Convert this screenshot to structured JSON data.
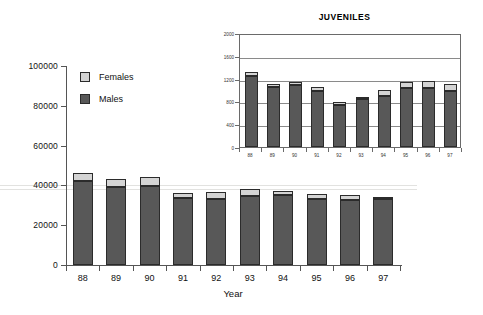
{
  "chart_data": [
    {
      "id": "main",
      "type": "bar",
      "subtype": "stacked",
      "title": "",
      "xlabel": "Year",
      "ylabel": "",
      "categories": [
        "88",
        "89",
        "90",
        "91",
        "92",
        "93",
        "94",
        "95",
        "96",
        "97"
      ],
      "ylim": [
        0,
        100000
      ],
      "yticks": [
        0,
        20000,
        40000,
        60000,
        80000,
        100000
      ],
      "ytick_labels": [
        "0",
        "20000",
        "40000",
        "60000",
        "80000",
        "100000"
      ],
      "grid": true,
      "legend_position": "upper-left-inside",
      "series": [
        {
          "name": "Males",
          "color": "#585858",
          "values": [
            42000,
            39000,
            39500,
            33500,
            33000,
            34500,
            35000,
            33000,
            32500,
            33000
          ]
        },
        {
          "name": "Females",
          "color": "#d4d4d4",
          "values": [
            4000,
            4000,
            4500,
            2500,
            3500,
            3500,
            2000,
            2500,
            2500,
            1000
          ]
        }
      ],
      "totals": [
        46000,
        43000,
        44000,
        36000,
        36500,
        38000,
        37000,
        35500,
        35000,
        34000
      ]
    },
    {
      "id": "inset",
      "type": "bar",
      "subtype": "stacked",
      "title": "JUVENILES",
      "xlabel": "",
      "ylabel": "",
      "categories": [
        "88",
        "89",
        "90",
        "91",
        "92",
        "93",
        "94",
        "95",
        "96",
        "97"
      ],
      "ylim": [
        0,
        2000
      ],
      "yticks": [
        0,
        400,
        800,
        1200,
        1600,
        2000
      ],
      "ytick_labels": [
        "0",
        "400",
        "800",
        "1200",
        "1600",
        "2000"
      ],
      "grid": true,
      "legend_position": "none",
      "series": [
        {
          "name": "Males",
          "color": "#585858",
          "values": [
            1240,
            1060,
            1090,
            980,
            740,
            840,
            900,
            1040,
            1040,
            980
          ]
        },
        {
          "name": "Females",
          "color": "#d4d4d4",
          "values": [
            80,
            50,
            50,
            70,
            50,
            20,
            100,
            100,
            120,
            120
          ]
        }
      ],
      "totals": [
        1320,
        1110,
        1140,
        1050,
        790,
        860,
        1000,
        1140,
        1160,
        1100
      ]
    }
  ],
  "legend": {
    "items": [
      {
        "label": "Females",
        "color": "#d4d4d4"
      },
      {
        "label": "Males",
        "color": "#585858"
      }
    ]
  },
  "main_axis": {
    "xlabel": "Year"
  },
  "inset": {
    "title": "JUVENILES"
  },
  "colors": {
    "males": "#585858",
    "females": "#d4d4d4",
    "outline": "#2b2b2b",
    "axis": "#555555",
    "grid_main": "#e2e2e0",
    "grid_inset": "#8a8a8a",
    "background": "#ffffff"
  }
}
